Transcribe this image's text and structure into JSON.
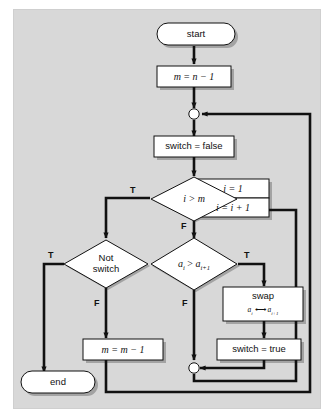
{
  "diagram": {
    "type": "flowchart",
    "background_color": "#d8d8d8",
    "page_color": "#ffffff",
    "node_fill": "#ffffff",
    "stroke_color": "#111111",
    "nodes": {
      "start": {
        "shape": "terminator",
        "label": "start"
      },
      "init_m": {
        "shape": "process",
        "label": "m = n − 1"
      },
      "merge_top": {
        "shape": "connector",
        "label": ""
      },
      "switch_false": {
        "shape": "process",
        "label": "switch = false"
      },
      "cond_i_gt_m": {
        "shape": "decision",
        "label": "i > m"
      },
      "i_init": {
        "shape": "process",
        "label": "i = 1"
      },
      "i_incr": {
        "shape": "process",
        "label": "i = i + 1"
      },
      "cond_not_switch": {
        "shape": "decision",
        "label_line1": "Not",
        "label_line2": "switch"
      },
      "cond_compare": {
        "shape": "decision",
        "label": "a_i > a_i+1"
      },
      "swap": {
        "shape": "process",
        "label_line1": "swap",
        "label_line2": "a_i ⟷ a_i+1"
      },
      "switch_true": {
        "shape": "process",
        "label": "switch = true"
      },
      "dec_m": {
        "shape": "process",
        "label": "m = m − 1"
      },
      "merge_bottom": {
        "shape": "connector",
        "label": ""
      },
      "end": {
        "shape": "terminator",
        "label": "end"
      }
    },
    "edge_labels": {
      "i_gt_m_true": "T",
      "i_gt_m_false": "F",
      "not_switch_true": "T",
      "not_switch_false": "F",
      "compare_true": "T",
      "compare_false": "F"
    }
  }
}
